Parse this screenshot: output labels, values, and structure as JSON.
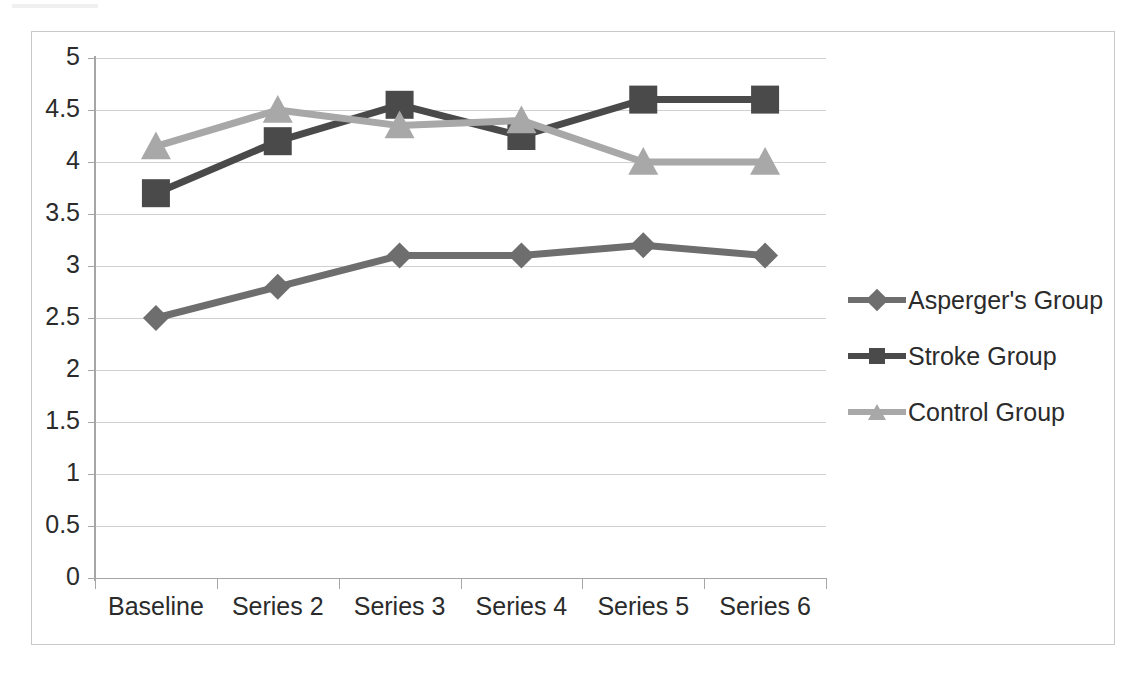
{
  "chart_data": {
    "type": "line",
    "title": "",
    "xlabel": "",
    "ylabel": "",
    "categories": [
      "Baseline",
      "Series 2",
      "Series 3",
      "Series 4",
      "Series 5",
      "Series 6"
    ],
    "ylim": [
      0,
      5
    ],
    "ytick_step": 0.5,
    "yticks": [
      "5",
      "4.5",
      "4",
      "3.5",
      "3",
      "2.5",
      "2",
      "1.5",
      "1",
      "0.5",
      "0"
    ],
    "grid": true,
    "legend_position": "right",
    "series": [
      {
        "name": "Asperger's Group",
        "marker": "diamond",
        "color": "#6e6e6e",
        "values": [
          2.5,
          2.8,
          3.1,
          3.1,
          3.2,
          3.1
        ]
      },
      {
        "name": "Stroke Group",
        "marker": "square",
        "color": "#4a4a4a",
        "values": [
          3.7,
          4.2,
          4.55,
          4.25,
          4.6,
          4.6
        ]
      },
      {
        "name": "Control Group",
        "marker": "triangle",
        "color": "#a8a8a8",
        "values": [
          4.15,
          4.5,
          4.35,
          4.4,
          4.0,
          4.0
        ]
      }
    ]
  },
  "legend": {
    "items": [
      {
        "label": "Asperger's Group",
        "color": "#6e6e6e",
        "marker": "diamond"
      },
      {
        "label": "Stroke Group",
        "color": "#4a4a4a",
        "marker": "square"
      },
      {
        "label": "Control Group",
        "color": "#a8a8a8",
        "marker": "triangle"
      }
    ]
  },
  "axes": {
    "y_labels": [
      "5",
      "4.5",
      "4",
      "3.5",
      "3",
      "2.5",
      "2",
      "1.5",
      "1",
      "0.5",
      "0"
    ],
    "x_labels": [
      "Baseline",
      "Series 2",
      "Series 3",
      "Series 4",
      "Series 5",
      "Series 6"
    ]
  },
  "style": {
    "grid_color": "#d0d0d0",
    "axis_color": "#a6a6a6",
    "frame_color": "#c9c9c9",
    "text_color": "#2b2b2b",
    "background": "#ffffff"
  }
}
